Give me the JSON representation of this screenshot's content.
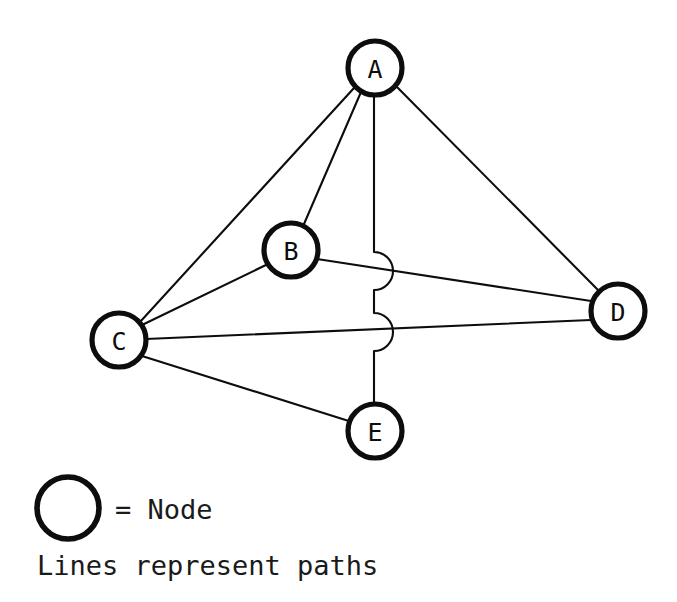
{
  "diagram": {
    "background_color": "#ffffff",
    "stroke_color": "#0d0d0d",
    "nodes": [
      {
        "id": "A",
        "label": "A",
        "cx": 375,
        "cy": 68,
        "r": 27
      },
      {
        "id": "B",
        "label": "B",
        "cx": 291,
        "cy": 250,
        "r": 27
      },
      {
        "id": "C",
        "label": "C",
        "cx": 119,
        "cy": 340,
        "r": 27
      },
      {
        "id": "D",
        "label": "D",
        "cx": 618,
        "cy": 311,
        "r": 27
      },
      {
        "id": "E",
        "label": "E",
        "cx": 375,
        "cy": 431,
        "r": 27
      }
    ],
    "edges": [
      {
        "id": "A-C",
        "from": "A",
        "to": "C",
        "style": "straight"
      },
      {
        "id": "A-B",
        "from": "A",
        "to": "B",
        "style": "straight"
      },
      {
        "id": "A-D",
        "from": "A",
        "to": "D",
        "style": "straight"
      },
      {
        "id": "A-E",
        "from": "A",
        "to": "E",
        "style": "hopped",
        "hops": 2
      },
      {
        "id": "B-C",
        "from": "B",
        "to": "C",
        "style": "straight"
      },
      {
        "id": "B-D",
        "from": "B",
        "to": "D",
        "style": "straight"
      },
      {
        "id": "C-D",
        "from": "C",
        "to": "D",
        "style": "straight"
      },
      {
        "id": "C-E",
        "from": "C",
        "to": "E",
        "style": "straight"
      }
    ]
  },
  "legend": {
    "node_symbol_label": "= Node",
    "caption": "Lines represent paths",
    "symbol_cx": 68,
    "symbol_cy": 508,
    "symbol_r": 31
  }
}
